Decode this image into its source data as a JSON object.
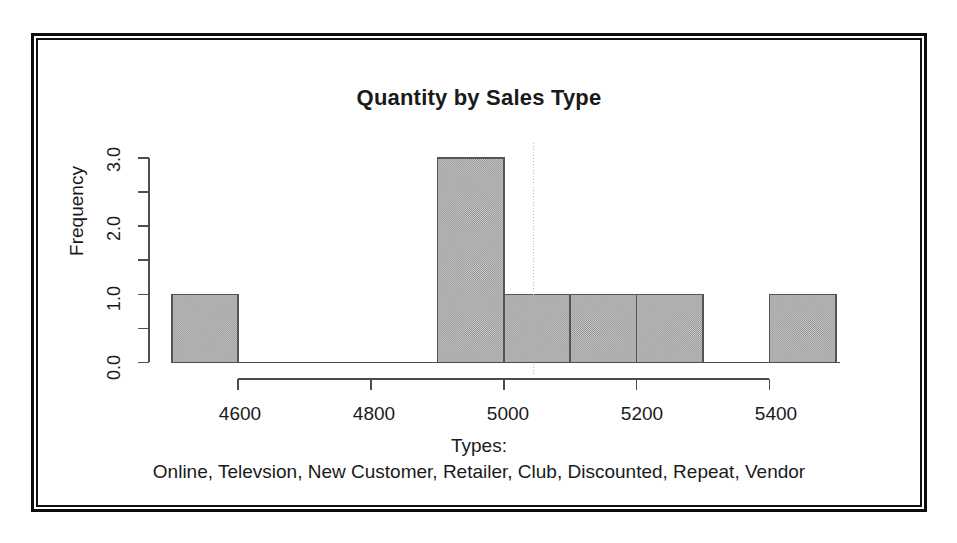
{
  "chart_data": {
    "type": "bar",
    "title": "Quantity by Sales Type",
    "xlabel": "",
    "ylabel": "Frequency",
    "caption_heading": "Types:",
    "caption_list": "Online, Televsion, New Customer, Retailer, Club, Discounted, Repeat, Vendor",
    "histogram_bin_width": 100,
    "bins": [
      {
        "x_start": 4500,
        "x_end": 4600,
        "frequency": 1
      },
      {
        "x_start": 4600,
        "x_end": 4700,
        "frequency": 0
      },
      {
        "x_start": 4700,
        "x_end": 4800,
        "frequency": 0
      },
      {
        "x_start": 4800,
        "x_end": 4900,
        "frequency": 0
      },
      {
        "x_start": 4900,
        "x_end": 5000,
        "frequency": 3
      },
      {
        "x_start": 5000,
        "x_end": 5100,
        "frequency": 1
      },
      {
        "x_start": 5100,
        "x_end": 5200,
        "frequency": 1
      },
      {
        "x_start": 5200,
        "x_end": 5300,
        "frequency": 1
      },
      {
        "x_start": 5300,
        "x_end": 5400,
        "frequency": 0
      },
      {
        "x_start": 5400,
        "x_end": 5500,
        "frequency": 1
      }
    ],
    "xticks": [
      4600,
      4800,
      5000,
      5200,
      5400
    ],
    "xtick_labels": [
      "4600",
      "4800",
      "5000",
      "5200",
      "5400"
    ],
    "yticks": [
      0.0,
      0.5,
      1.0,
      1.5,
      2.0,
      2.5,
      3.0
    ],
    "ytick_labels": [
      "0.0",
      "",
      "1.0",
      "",
      "2.0",
      "",
      "3.0"
    ],
    "xlim": [
      4500,
      5500
    ],
    "ylim": [
      0,
      3
    ],
    "grid": false,
    "legend": "none",
    "reference_line_x": 5045,
    "colors": {
      "bar_fill": "#aeaeae",
      "bar_stroke": "#555555",
      "axis": "#4d4d4d",
      "text": "#1a1a1a",
      "frame": "#0d0d0d",
      "reference_line": "#b9b9b9",
      "background": "#ffffff"
    }
  }
}
